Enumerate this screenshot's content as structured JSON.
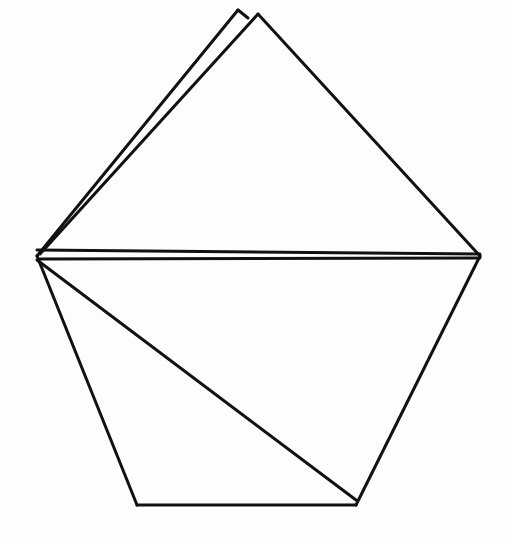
{
  "figure": {
    "stroke_color": "#111111",
    "background": "#fdfdfd",
    "vertices": {
      "apex_a": [
        238,
        10
      ],
      "apex_b": [
        258,
        14
      ],
      "left": [
        37,
        256
      ],
      "right": [
        480,
        256
      ],
      "bottom_left": [
        137,
        505
      ],
      "bottom_right": [
        356,
        505
      ]
    },
    "lines": [
      {
        "name": "flap-left-edge-a",
        "from": [
          37,
          256
        ],
        "to": [
          238,
          10
        ]
      },
      {
        "name": "flap-left-edge-b",
        "from": [
          40,
          254
        ],
        "to": [
          258,
          14
        ]
      },
      {
        "name": "apex-connector",
        "from": [
          238,
          10
        ],
        "to": [
          248,
          18
        ]
      },
      {
        "name": "flap-right-edge",
        "from": [
          258,
          14
        ],
        "to": [
          480,
          256
        ]
      },
      {
        "name": "fold-line-upper",
        "from": [
          37,
          250
        ],
        "to": [
          480,
          254
        ]
      },
      {
        "name": "fold-line-lower",
        "from": [
          40,
          259
        ],
        "to": [
          480,
          258
        ]
      },
      {
        "name": "pentagon-left-edge",
        "from": [
          37,
          256
        ],
        "to": [
          137,
          505
        ]
      },
      {
        "name": "pentagon-bottom-edge",
        "from": [
          137,
          505
        ],
        "to": [
          356,
          505
        ]
      },
      {
        "name": "pentagon-right-edge",
        "from": [
          356,
          505
        ],
        "to": [
          480,
          256
        ]
      },
      {
        "name": "interior-diagonal",
        "from": [
          37,
          260
        ],
        "to": [
          356,
          500
        ]
      }
    ]
  }
}
